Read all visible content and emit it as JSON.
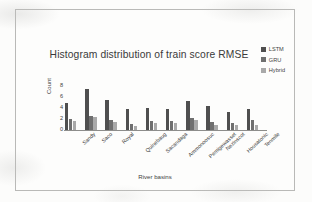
{
  "chart_data": {
    "type": "bar",
    "title": "Histogram distribution of train score RMSE",
    "xlabel": "River basins",
    "ylabel": "Count",
    "ylim": [
      0,
      8
    ],
    "yticks": [
      0,
      2,
      4,
      6,
      8
    ],
    "grid": false,
    "legend_position": "top-right",
    "categories": [
      "Sandy",
      "Saco",
      "Royal",
      "Quinebaug",
      "Sacandaga",
      "Ammonoosuc",
      "Pemigewasset",
      "Nezinscot",
      "Housatonic",
      "Tenmile"
    ],
    "series": [
      {
        "name": "LSTM",
        "color": "#4f4f4f",
        "values": [
          5.0,
          7.5,
          5.5,
          3.8,
          4.0,
          3.9,
          5.3,
          4.4,
          3.2,
          3.8
        ]
      },
      {
        "name": "GRU",
        "color": "#6f6f6f",
        "values": [
          2.0,
          2.6,
          1.8,
          1.1,
          1.7,
          1.6,
          2.1,
          1.4,
          1.2,
          1.9
        ]
      },
      {
        "name": "Hybrid",
        "color": "#a9a9a9",
        "values": [
          1.6,
          2.4,
          1.5,
          0.7,
          1.3,
          1.3,
          1.9,
          1.0,
          0.9,
          1.0
        ]
      }
    ]
  }
}
